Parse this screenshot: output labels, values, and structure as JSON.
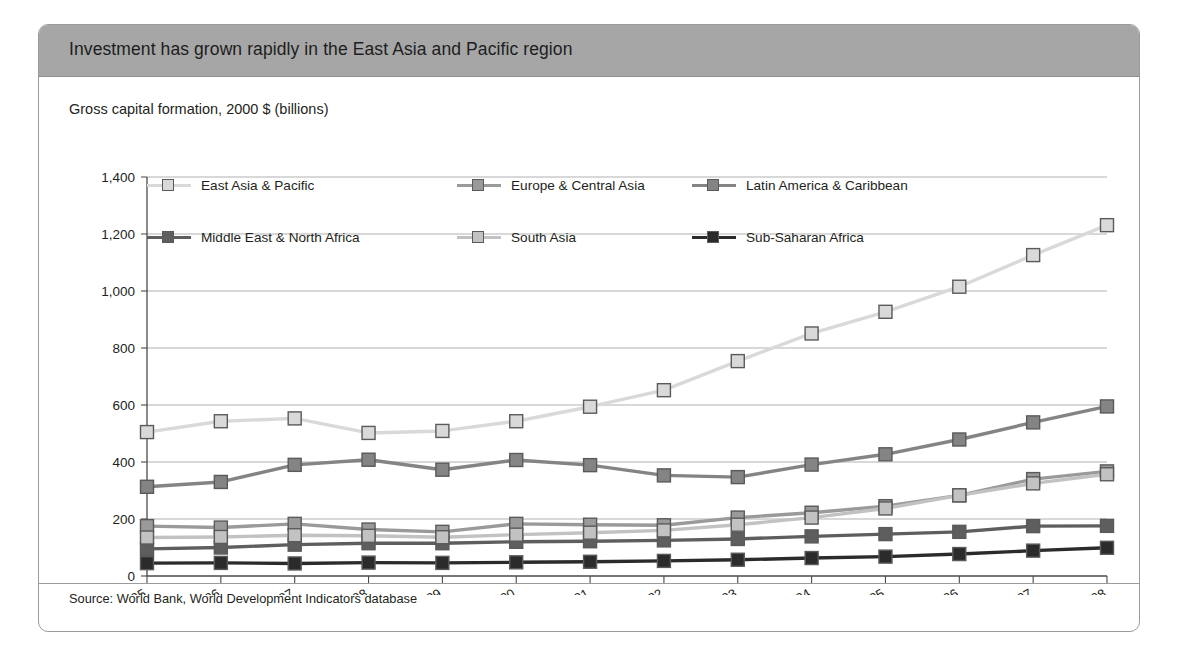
{
  "figure": {
    "title": "Investment has grown rapidly in the East Asia and Pacific region",
    "axis_caption": "Gross capital formation, 2000 $ (billions)",
    "source": "Source: World Bank, World Development Indicators database",
    "header_color": "#a6a6a6",
    "border_color": "#9b9b9b"
  },
  "legend": {
    "rows": [
      [
        {
          "label": "East Asia & Pacific",
          "color": "#d9d9d9"
        },
        {
          "label": "Europe & Central Asia",
          "color": "#9a9a9a"
        },
        {
          "label": "Latin America & Caribbean",
          "color": "#848484"
        }
      ],
      [
        {
          "label": "Middle East & North Africa",
          "color": "#5e5e5e"
        },
        {
          "label": "South Asia",
          "color": "#c2c2c2"
        },
        {
          "label": "Sub-Saharan Africa",
          "color": "#2b2b2b"
        }
      ]
    ]
  },
  "chart_data": {
    "type": "line",
    "title": "Investment has grown rapidly in the East Asia and Pacific region",
    "subtitle": "Gross capital formation, 2000 $ (billions)",
    "xlabel": "",
    "ylabel": "Gross capital formation, 2000 $ (billions)",
    "ylim": [
      0,
      1400
    ],
    "ytick_values": [
      0,
      200,
      400,
      600,
      800,
      1000,
      1200,
      1400
    ],
    "ytick_labels": [
      "0",
      "200",
      "400",
      "600",
      "800",
      "1,000",
      "1,200",
      "1,400"
    ],
    "grid": true,
    "legend_position": "top-inside",
    "categories": [
      "1995",
      "1996",
      "1997",
      "1998",
      "1999",
      "2000",
      "2001",
      "2002",
      "2003",
      "2004",
      "2005",
      "2006",
      "2007",
      "2008"
    ],
    "x": [
      1995,
      1996,
      1997,
      1998,
      1999,
      2000,
      2001,
      2002,
      2003,
      2004,
      2005,
      2006,
      2007,
      2008
    ],
    "series": [
      {
        "name": "East Asia & Pacific",
        "color": "#d9d9d9",
        "values": [
          505,
          543,
          553,
          502,
          509,
          543,
          594,
          652,
          754,
          851,
          927,
          1015,
          1126,
          1231
        ]
      },
      {
        "name": "Europe & Central Asia",
        "color": "#9a9a9a",
        "values": [
          175,
          170,
          183,
          163,
          155,
          183,
          180,
          178,
          205,
          222,
          245,
          283,
          340,
          367
        ]
      },
      {
        "name": "Latin America & Caribbean",
        "color": "#848484",
        "values": [
          313,
          330,
          390,
          408,
          373,
          407,
          389,
          353,
          347,
          391,
          427,
          479,
          539,
          595
        ]
      },
      {
        "name": "Middle East & North Africa",
        "color": "#5e5e5e",
        "values": [
          95,
          100,
          110,
          115,
          115,
          120,
          122,
          125,
          130,
          139,
          147,
          155,
          175,
          176
        ]
      },
      {
        "name": "South Asia",
        "color": "#c2c2c2",
        "values": [
          135,
          137,
          143,
          141,
          136,
          145,
          152,
          160,
          180,
          205,
          237,
          283,
          325,
          357
        ]
      },
      {
        "name": "Sub-Saharan Africa",
        "color": "#2b2b2b",
        "values": [
          45,
          46,
          44,
          47,
          46,
          48,
          50,
          53,
          57,
          63,
          68,
          77,
          89,
          99
        ]
      }
    ]
  }
}
